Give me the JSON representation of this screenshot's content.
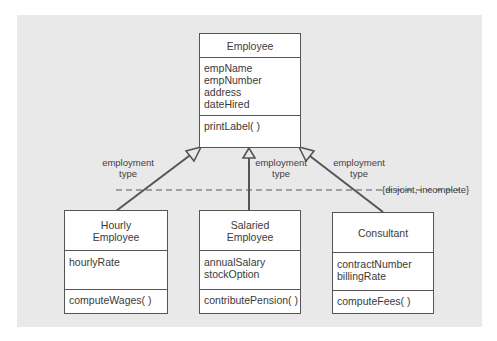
{
  "diagram": {
    "type": "UML class diagram - generalization",
    "colors": {
      "panel": "#e9e9e9",
      "box": "#ffffff",
      "line": "#555555",
      "text": "#3a3a3a"
    },
    "superclass": {
      "name": "Employee",
      "attributes": [
        "empName",
        "empNumber",
        "address",
        "dateHired"
      ],
      "operations": [
        "printLabel( )"
      ]
    },
    "subclasses": [
      {
        "name_line1": "Hourly",
        "name_line2": "Employee",
        "attributes": [
          "hourlyRate"
        ],
        "operations": [
          "computeWages( )"
        ]
      },
      {
        "name_line1": "Salaried",
        "name_line2": "Employee",
        "attributes": [
          "annualSalary",
          "stockOption"
        ],
        "operations": [
          "contributePension( )"
        ]
      },
      {
        "name_line1": "Consultant",
        "attributes": [
          "contractNumber",
          "billingRate"
        ],
        "operations": [
          "computeFees( )"
        ]
      }
    ],
    "discriminator_labels": [
      {
        "line1": "employment",
        "line2": "type"
      },
      {
        "line1": "employment",
        "line2": "type"
      },
      {
        "line1": "employment",
        "line2": "type"
      }
    ],
    "constraint": "{disjoint, incomplete}"
  }
}
